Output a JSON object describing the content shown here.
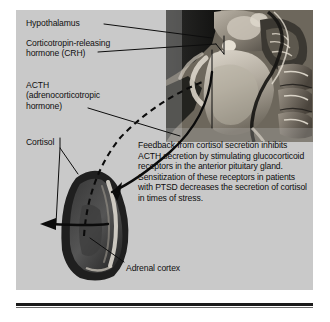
{
  "figure": {
    "background_color": "#c9c9c9",
    "text_color": "#101010"
  },
  "labels": {
    "hypothalamus": "Hypothalamus",
    "crh": "Corticotropin-releasing\nhormone (CRH)",
    "acth": "ACTH\n(adrenocorticotropic\nhormone)",
    "cortisol": "Cortisol",
    "adrenal_cortex": "Adrenal cortex"
  },
  "paragraph": {
    "feedback_text": "Feedback from cortisol secretion inhibits ACTH secretion by stimulating glucocorticoid receptors in the anterior pituitary gland. Sensitization of these receptors in patients with PTSD decreases the secretion of cortisol in times of stress."
  },
  "annotations": {
    "leader_lines": [
      "hypothalamus-leader",
      "crh-leader",
      "acth-leader",
      "cortisol-bracket",
      "adrenal-cortex-leader",
      "pituitary-pointer"
    ],
    "arrows": [
      {
        "name": "acth-solid-arrow",
        "style": "solid",
        "direction": "hypothalamus-to-adrenal"
      },
      {
        "name": "cortisol-dashed-arrow",
        "style": "dashed",
        "direction": "adrenal-to-brain"
      },
      {
        "name": "cortisol-release-arrow",
        "style": "solid",
        "direction": "leftward-out-of-gland"
      }
    ]
  },
  "colors": {
    "panel_background": "#c9c9c9",
    "ink": "#101010",
    "gland_dark": "#2d2d2d",
    "gland_mid": "#4e4e4e",
    "photo_dark": "#1d1d1d",
    "photo_light": "#d8d4cc",
    "rule": "#1a1a1a"
  }
}
